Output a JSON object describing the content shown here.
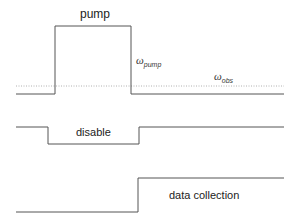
{
  "diagram": {
    "title": "",
    "colors": {
      "line": "#555555",
      "dotted": "#aaaaaa",
      "text": "#222222"
    },
    "signals": [
      {
        "name": "pump",
        "label": "pump",
        "shape": "pulse-high"
      },
      {
        "name": "disable",
        "label": "disable",
        "shape": "pulse-low"
      },
      {
        "name": "data-collection",
        "label": "data collection",
        "shape": "step-up"
      }
    ],
    "annotations": {
      "omega_pump": {
        "symbol": "ω",
        "subscript": "pump"
      },
      "omega_obs": {
        "symbol": "ω",
        "subscript": "obs"
      }
    }
  }
}
